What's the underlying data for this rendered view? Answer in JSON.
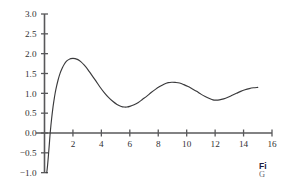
{
  "chart_data": {
    "type": "line",
    "title": "",
    "subtitle": "",
    "xlabel": "",
    "ylabel": "",
    "xlim": [
      -0.6,
      16.0
    ],
    "ylim": [
      -1.0,
      3.0
    ],
    "grid": false,
    "legend": null,
    "x_ticks": [
      2,
      4,
      6,
      8,
      10,
      12,
      14,
      16
    ],
    "x_tick_labels": [
      "2",
      "4",
      "6",
      "8",
      "10",
      "12",
      "14",
      "16"
    ],
    "y_ticks": [
      -1.0,
      -0.5,
      0.0,
      0.5,
      1.0,
      1.5,
      2.0,
      2.5,
      3.0
    ],
    "y_tick_labels": [
      "−1.0",
      "−0.5",
      "0.0",
      "0.5",
      "1.0",
      "1.5",
      "2.0",
      "2.5",
      "3.0"
    ],
    "series": [
      {
        "name": "response",
        "color": "#3a3a3c",
        "points": [
          [
            0.16,
            -1.0
          ],
          [
            0.22,
            -0.8
          ],
          [
            0.28,
            -0.55
          ],
          [
            0.34,
            -0.28
          ],
          [
            0.4,
            0.0
          ],
          [
            0.5,
            0.36
          ],
          [
            0.6,
            0.66
          ],
          [
            0.7,
            0.9
          ],
          [
            0.8,
            1.1
          ],
          [
            0.95,
            1.33
          ],
          [
            1.1,
            1.51
          ],
          [
            1.25,
            1.64
          ],
          [
            1.4,
            1.74
          ],
          [
            1.55,
            1.81
          ],
          [
            1.7,
            1.85
          ],
          [
            1.85,
            1.875
          ],
          [
            2.0,
            1.88
          ],
          [
            2.15,
            1.875
          ],
          [
            2.35,
            1.85
          ],
          [
            2.55,
            1.8
          ],
          [
            2.8,
            1.71
          ],
          [
            3.05,
            1.6
          ],
          [
            3.3,
            1.47
          ],
          [
            3.6,
            1.32
          ],
          [
            3.9,
            1.16
          ],
          [
            4.2,
            1.02
          ],
          [
            4.5,
            0.9
          ],
          [
            4.8,
            0.8
          ],
          [
            5.1,
            0.72
          ],
          [
            5.4,
            0.67
          ],
          [
            5.6,
            0.655
          ],
          [
            5.8,
            0.655
          ],
          [
            6.0,
            0.67
          ],
          [
            6.3,
            0.71
          ],
          [
            6.6,
            0.77
          ],
          [
            6.9,
            0.85
          ],
          [
            7.2,
            0.93
          ],
          [
            7.5,
            1.02
          ],
          [
            7.8,
            1.1
          ],
          [
            8.1,
            1.17
          ],
          [
            8.4,
            1.23
          ],
          [
            8.7,
            1.27
          ],
          [
            8.95,
            1.28
          ],
          [
            9.2,
            1.275
          ],
          [
            9.5,
            1.26
          ],
          [
            9.8,
            1.22
          ],
          [
            10.1,
            1.17
          ],
          [
            10.4,
            1.11
          ],
          [
            10.7,
            1.05
          ],
          [
            11.0,
            0.98
          ],
          [
            11.3,
            0.92
          ],
          [
            11.6,
            0.87
          ],
          [
            11.85,
            0.835
          ],
          [
            12.05,
            0.83
          ],
          [
            12.3,
            0.835
          ],
          [
            12.6,
            0.86
          ],
          [
            12.9,
            0.9
          ],
          [
            13.2,
            0.95
          ],
          [
            13.5,
            1.0
          ],
          [
            13.8,
            1.05
          ],
          [
            14.1,
            1.09
          ],
          [
            14.4,
            1.12
          ],
          [
            14.7,
            1.14
          ],
          [
            15.0,
            1.15
          ]
        ]
      }
    ],
    "annotations": []
  },
  "caption": {
    "title": "Fi",
    "subtitle": "G"
  }
}
